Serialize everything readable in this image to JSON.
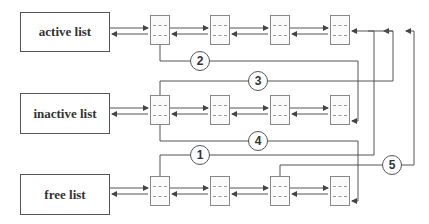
{
  "lists": [
    {
      "id": "active",
      "label": "active list"
    },
    {
      "id": "inactive",
      "label": "inactive list"
    },
    {
      "id": "free",
      "label": "free list"
    }
  ],
  "nodes_per_list": 4,
  "transitions": [
    {
      "label": "1",
      "from": "inactive list tail region",
      "to": "free list head"
    },
    {
      "label": "2",
      "from": "active list head",
      "to": "inactive list tail"
    },
    {
      "label": "3",
      "from": "inactive list head",
      "to": "active list tail"
    },
    {
      "label": "4",
      "from": "inactive list head",
      "to": "free list tail"
    },
    {
      "label": "5",
      "from": "free list node 3",
      "to": "active list tail"
    }
  ],
  "colors": {
    "line": "#555555",
    "box_border": "#555555",
    "node_border": "#888888",
    "text": "#333333"
  }
}
